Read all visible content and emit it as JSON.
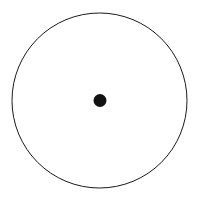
{
  "canvas": {
    "width": 200,
    "height": 201,
    "background_color": "#ffffff"
  },
  "figure": {
    "title": ""
  },
  "chart_data": {
    "type": "scatter",
    "title": "",
    "xlabel": "",
    "ylabel": "",
    "grid": false,
    "legend": null,
    "xlim": [
      0,
      200
    ],
    "ylim": [
      0,
      201
    ],
    "shapes": [
      {
        "name": "outer-circle",
        "kind": "circle-outline",
        "cx": 99.5,
        "cy": 100.5,
        "r": 87.5,
        "stroke_color": "#1a1a1a",
        "stroke_width": 1,
        "fill": "none"
      },
      {
        "name": "center-dot",
        "kind": "circle-filled",
        "cx": 100,
        "cy": 100.5,
        "r": 6.5,
        "fill_color": "#121212",
        "stroke_color": "none",
        "stroke_width": 0
      }
    ],
    "points": [
      {
        "label": "center",
        "x": 100,
        "y": 100.5
      }
    ]
  }
}
